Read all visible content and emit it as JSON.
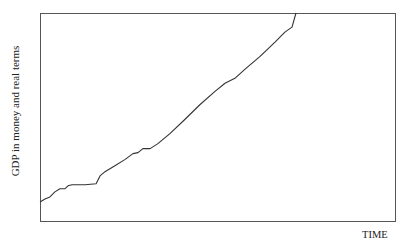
{
  "chart_data": {
    "type": "line",
    "title": "",
    "xlabel": "TIME",
    "ylabel": "GDP in money and real terms",
    "grid": false,
    "legend": null,
    "x_ticks": [],
    "y_ticks": [],
    "xlim": [
      0,
      100
    ],
    "ylim": [
      0,
      100
    ],
    "series": [
      {
        "name": "GDP",
        "color": "#333333",
        "x": [
          0,
          1.4,
          2.8,
          4.2,
          5.6,
          7.0,
          7.9,
          9.0,
          12.7,
          15.8,
          16.9,
          18.3,
          21.1,
          23.9,
          26.2,
          27.6,
          29.0,
          31.0,
          33.2,
          36.6,
          40.8,
          45.1,
          49.3,
          52.1,
          54.9,
          57.7,
          62.0,
          66.2,
          69.0,
          71.0,
          72.1
        ],
        "y": [
          9.2,
          10.6,
          11.6,
          14.0,
          15.5,
          15.5,
          16.9,
          17.4,
          17.4,
          17.9,
          21.7,
          23.7,
          26.6,
          29.5,
          32.4,
          32.9,
          34.8,
          34.8,
          37.2,
          42.0,
          48.8,
          56.0,
          62.3,
          66.2,
          68.6,
          72.9,
          79.2,
          86.0,
          90.8,
          93.2,
          100.0
        ]
      }
    ]
  },
  "plot": {
    "box": {
      "left": 40,
      "top": 13,
      "right": 395,
      "bottom": 221
    }
  }
}
